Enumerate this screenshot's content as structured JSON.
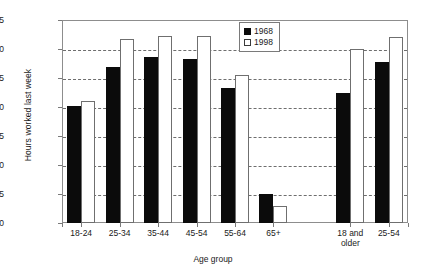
{
  "chart_data": {
    "type": "bar",
    "title": "",
    "xlabel": "Age group",
    "ylabel": "Hours worked last week",
    "ylim": [
      0,
      35
    ],
    "ytick_step": 5,
    "yticks": [
      0,
      5,
      10,
      15,
      20,
      25,
      30,
      35
    ],
    "ytick_labels": [
      "0",
      "5",
      "10",
      "15",
      "20",
      "25",
      "30",
      "35"
    ],
    "grid": true,
    "grid_axis": "y",
    "grid_style": "dashed",
    "legend_position": "top-right-inside",
    "categories": [
      "18-24",
      "25-34",
      "35-44",
      "45-54",
      "55-64",
      "65+",
      "18 and older",
      "25-54"
    ],
    "category_display": [
      "18-24",
      "25-34",
      "35-44",
      "45-54",
      "55-64",
      "65+",
      "18 and\nolder",
      "25-54"
    ],
    "group_gap_after_index": 5,
    "series": [
      {
        "name": "1968",
        "color": "#0b0b0b",
        "fill": "solid",
        "values": [
          20.1,
          26.9,
          28.6,
          28.3,
          23.3,
          5.0,
          22.5,
          27.8
        ]
      },
      {
        "name": "1998",
        "color": "#ffffff",
        "fill": "hollow",
        "edge_color": "#6f6f6f",
        "values": [
          21.0,
          31.8,
          32.3,
          32.2,
          25.5,
          3.0,
          30.0,
          32.0
        ]
      }
    ]
  },
  "legend": {
    "items": [
      {
        "label": "1968",
        "swatch": "filled-black-square"
      },
      {
        "label": "1998",
        "swatch": "hollow-white-square"
      }
    ]
  },
  "axes": {
    "y_title": "Hours worked last week",
    "x_title": "Age group"
  }
}
